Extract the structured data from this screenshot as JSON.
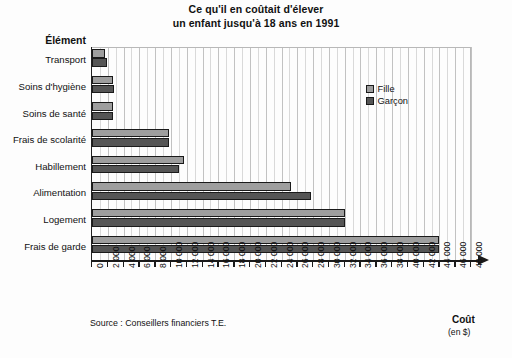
{
  "title": {
    "line1": "Ce qu'il en coûtait d'élever",
    "line2": "un enfant jusqu'à 18 ans en 1991"
  },
  "y_axis_title": "Élément",
  "x_axis_title": "Coût",
  "x_axis_units": "(en $)",
  "source_note": "Source : Conseillers financiers T.E.",
  "legend": {
    "items": [
      {
        "label": "Fille",
        "color": "#9e9e9e"
      },
      {
        "label": "Garçon",
        "color": "#555555"
      }
    ]
  },
  "colors": {
    "fille": "#9e9e9e",
    "garcon": "#555555",
    "axis": "#1a1a1a",
    "gridline": "#c2c2c2",
    "background": "#fdfdfd"
  },
  "chart_data": {
    "type": "bar",
    "orientation": "horizontal",
    "title": "Ce qu'il en coûtait d'élever un enfant jusqu'à 18 ans en 1991",
    "xlabel": "Coût (en $)",
    "ylabel": "Élément",
    "xlim": [
      0,
      48000
    ],
    "xtick_step": 2000,
    "xticks": [
      "0",
      "2 000",
      "4 000",
      "6 000",
      "8 000",
      "10 000",
      "12 000",
      "14 000",
      "16 000",
      "18 000",
      "20 000",
      "22 000",
      "24 000",
      "26 000",
      "28 000",
      "30 000",
      "32 000",
      "34 000",
      "36 000",
      "38 000",
      "40 000",
      "42 000",
      "44 000",
      "46 000",
      "48 000"
    ],
    "xtick_values": [
      0,
      2000,
      4000,
      6000,
      8000,
      10000,
      12000,
      14000,
      16000,
      18000,
      20000,
      22000,
      24000,
      26000,
      28000,
      30000,
      32000,
      34000,
      36000,
      38000,
      40000,
      42000,
      44000,
      46000,
      48000
    ],
    "grid": true,
    "legend_position": "upper right",
    "categories": [
      "Transport",
      "Soins d'hygiène",
      "Soins de santé",
      "Frais de scolarité",
      "Habillement",
      "Alimentation",
      "Logement",
      "Frais de garde"
    ],
    "series": [
      {
        "name": "Fille",
        "color": "#9e9e9e",
        "values": [
          1700,
          2600,
          2700,
          9700,
          11600,
          25200,
          32000,
          44000
        ]
      },
      {
        "name": "Garçon",
        "color": "#555555",
        "values": [
          1900,
          2800,
          2700,
          9700,
          11000,
          27700,
          32000,
          44000
        ]
      }
    ],
    "source": "Source : Conseillers financiers T.E."
  }
}
